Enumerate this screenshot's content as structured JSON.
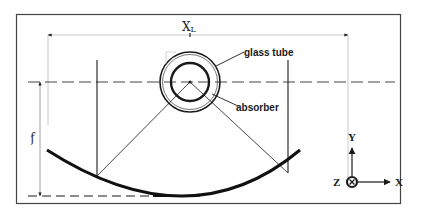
{
  "diagram": {
    "labels": {
      "aperture_width": "X",
      "aperture_width_sub": "L",
      "glass_tube": "glass tube",
      "absorber": "absorber",
      "focal_length": "f"
    },
    "axes": {
      "x": "X",
      "y": "Y",
      "z": "Z"
    },
    "colors": {
      "line": "#1a1a1a",
      "thin_line": "#555555",
      "light_line": "#bbbbbb",
      "frame": "#444444",
      "background": "#ffffff"
    }
  }
}
